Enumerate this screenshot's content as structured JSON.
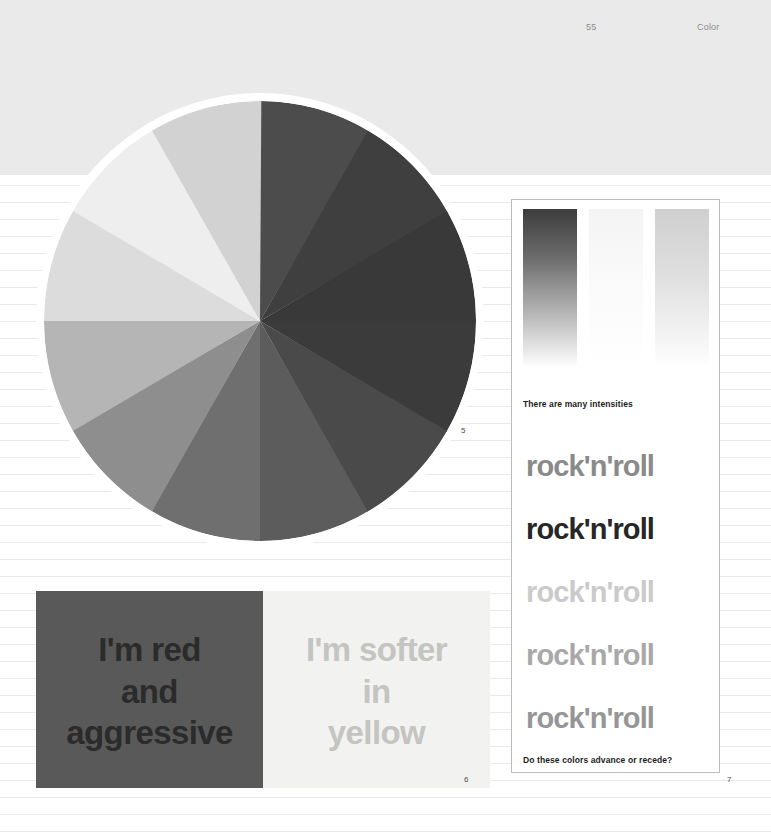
{
  "page": {
    "folio": "55",
    "section_title": "Color",
    "background_color": "#ffffff",
    "top_band_color": "#eaeaea"
  },
  "figures": {
    "wheel": {
      "number": "5",
      "label": "color-wheel"
    },
    "pair": {
      "number": "6",
      "red_panel": {
        "background": "#595959",
        "text_color": "#2b2b2b",
        "lines": [
          "I'm red",
          "and",
          "aggressive"
        ]
      },
      "yellow_panel": {
        "background": "#f2f2f0",
        "text_color": "#c4c4c0",
        "lines": [
          "I'm softer",
          "in",
          "yellow"
        ]
      }
    },
    "card": {
      "number": "7",
      "caption_top": "There are many intensities",
      "caption_bottom": "Do these colors advance or recede?",
      "gradients": [
        {
          "name": "dark-to-white",
          "from": "#3c3c3c",
          "to": "#ffffff"
        },
        {
          "name": "pale-to-white",
          "from": "#f4f4f4",
          "to": "#ffffff"
        },
        {
          "name": "mid-to-white",
          "from": "#cfcfcf",
          "to": "#ffffff"
        }
      ],
      "rock_lines": [
        {
          "text": "rock'n'roll",
          "color": "#8a8a8a"
        },
        {
          "text": "rock'n'roll",
          "color": "#262626"
        },
        {
          "text": "rock'n'roll",
          "color": "#cacaca"
        },
        {
          "text": "rock'n'roll",
          "color": "#a8a8a8"
        },
        {
          "text": "rock'n'roll",
          "color": "#969696"
        }
      ]
    }
  },
  "chart_data": {
    "type": "pie",
    "xlabel": "",
    "ylabel": "",
    "legend": "none",
    "categories": [
      "segment-1",
      "segment-2",
      "segment-3",
      "segment-4",
      "segment-5",
      "segment-6",
      "segment-7",
      "segment-8",
      "segment-9",
      "segment-10",
      "segment-11",
      "segment-12"
    ],
    "values": [
      30,
      30,
      30,
      30,
      30,
      30,
      30,
      30,
      30,
      30,
      30,
      30
    ],
    "slice_colors": [
      "#4c4c4c",
      "#3f3f3f",
      "#393939",
      "#3b3b3b",
      "#4a4a4a",
      "#5c5c5c",
      "#6f6f6f",
      "#8e8e8e",
      "#b5b5b5",
      "#dcdcdc",
      "#eeeeee",
      "#d2d2d2"
    ],
    "start_angle_deg": -90,
    "slice_span_deg": 30,
    "note": "12 equal sectors, clockwise from 12 o'clock; values shown as grayscale tonal steps"
  }
}
